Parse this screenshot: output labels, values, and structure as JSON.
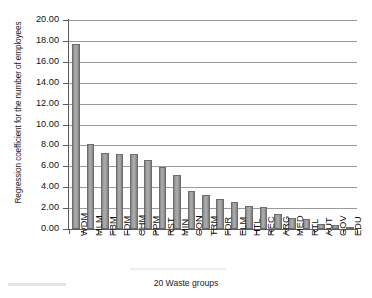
{
  "chart_data": {
    "type": "bar",
    "title": "",
    "xlabel": "20 Waste groups",
    "ylabel": "Regression coefficient for the number of employees",
    "categories": [
      "WDM",
      "MLM",
      "FBM",
      "FDM",
      "CHM",
      "PPM",
      "RST",
      "MIN",
      "CON",
      "TRM",
      "FDR",
      "ELM",
      "HTL",
      "REC",
      "ARG",
      "MED",
      "RTL",
      "AUT",
      "GOV",
      "EDU"
    ],
    "values": [
      17.7,
      8.15,
      7.3,
      7.15,
      7.15,
      6.6,
      5.95,
      5.2,
      3.65,
      3.3,
      2.85,
      2.55,
      2.2,
      2.1,
      1.45,
      1.1,
      0.95,
      0.45,
      0.35,
      0.2
    ],
    "ylim": [
      0,
      20
    ],
    "ytick_step": 2,
    "ytick_labels": [
      "0.00",
      "2.00",
      "4.00",
      "6.00",
      "8.00",
      "10.00",
      "12.00",
      "14.00",
      "16.00",
      "18.00",
      "20.00"
    ],
    "grid": true,
    "grid_axis": "y",
    "legend": "none",
    "bar_color": "#a0a0a0",
    "bar_border_color": "#6d6d6d",
    "grid_color": "#9a9a9a",
    "axis_color": "#5a5a5a"
  }
}
